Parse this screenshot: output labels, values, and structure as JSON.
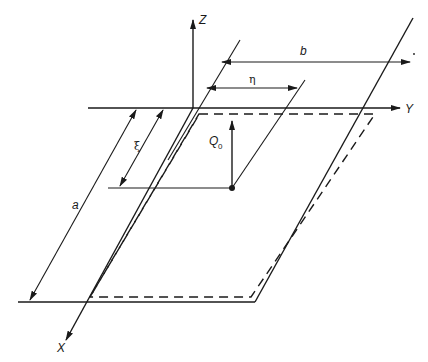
{
  "diagram": {
    "type": "plate-coordinate-system",
    "axes": {
      "x_label": "X",
      "y_label": "Y",
      "z_label": "Z"
    },
    "dimensions": {
      "length_a": "a",
      "width_b": "b",
      "load_offset_xi": "ξ",
      "load_offset_eta": "η"
    },
    "load": {
      "label": "Q",
      "subscript": "0"
    },
    "colors": {
      "line": "#1a1a1a",
      "background": "#ffffff"
    }
  }
}
